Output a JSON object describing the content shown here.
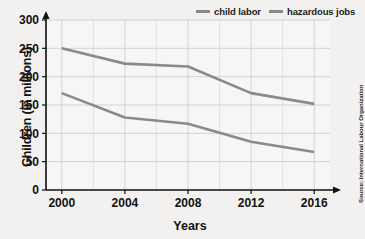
{
  "chart_data": {
    "type": "line",
    "title": "",
    "xlabel": "Years",
    "ylabel": "Children (in millions)",
    "x": [
      2000,
      2004,
      2008,
      2012,
      2016
    ],
    "xlim": [
      1999,
      2017
    ],
    "ylim": [
      0,
      300
    ],
    "x_ticks": [
      "2000",
      "2004",
      "2008",
      "2012",
      "2016"
    ],
    "y_ticks": [
      "0",
      "50",
      "100",
      "150",
      "200",
      "250",
      "300"
    ],
    "grid": true,
    "legend_position": "top-right",
    "line_color": "#8a8a8a",
    "series": [
      {
        "name": "child labor",
        "values": [
          250,
          223,
          218,
          171,
          152
        ]
      },
      {
        "name": "hazardous jobs",
        "values": [
          171,
          128,
          117,
          85,
          67
        ]
      }
    ],
    "source": "Source: International Labour Organization"
  },
  "legend": {
    "entries": [
      {
        "label": "child labor"
      },
      {
        "label": "hazardous jobs"
      }
    ]
  },
  "axes": {
    "y_title": "Children (in millions)",
    "x_title": "Years"
  },
  "source": {
    "text": "Source: International Labour Organization"
  }
}
